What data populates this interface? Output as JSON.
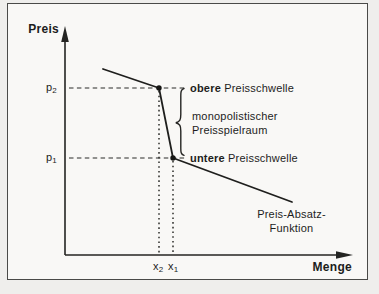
{
  "page": {
    "background_color": "#efeeec",
    "paper_color": "#f9f8f6",
    "line_color": "#242422"
  },
  "axes": {
    "y_label": "Preis",
    "x_label": "Menge"
  },
  "ticks": {
    "p2": {
      "base": "p",
      "sub": "2"
    },
    "p1": {
      "base": "p",
      "sub": "1"
    },
    "x2": {
      "base": "x",
      "sub": "2"
    },
    "x1": {
      "base": "x",
      "sub": "1"
    }
  },
  "annotations": {
    "upper_threshold": {
      "bold": "obere",
      "rest": " Preisschwelle"
    },
    "monopolistic_range": {
      "line1": "monopolistischer",
      "line2": "Preisspielraum"
    },
    "lower_threshold": {
      "bold": "untere",
      "rest": " Preisschwelle"
    },
    "demand_function": {
      "line1": "Preis-Absatz-",
      "line2": "Funktion"
    }
  }
}
